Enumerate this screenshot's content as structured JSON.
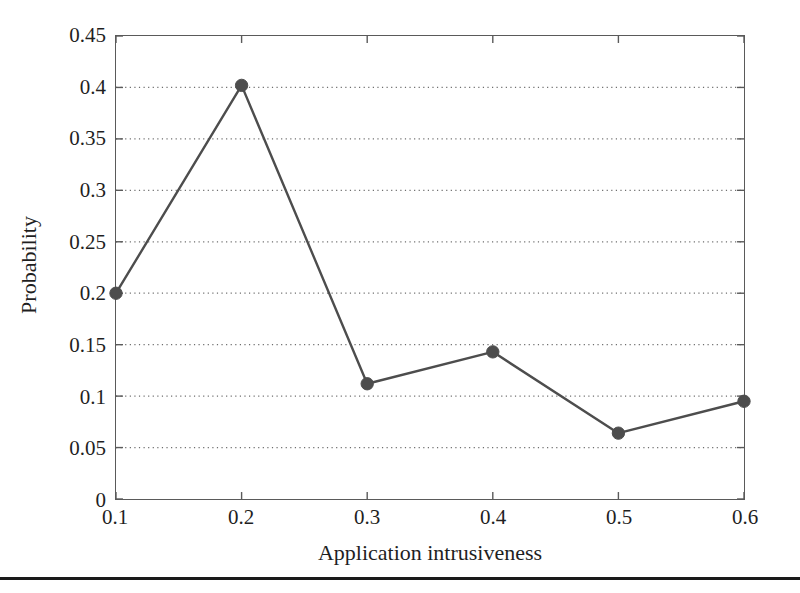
{
  "chart_data": {
    "type": "line",
    "title": "",
    "xlabel": "Application intrusiveness",
    "ylabel": "Probability",
    "x": [
      0.1,
      0.2,
      0.3,
      0.4,
      0.5,
      0.6
    ],
    "values": [
      0.2,
      0.402,
      0.112,
      0.143,
      0.064,
      0.095
    ],
    "series": [
      {
        "name": "Probability",
        "x": [
          0.1,
          0.2,
          0.3,
          0.4,
          0.5,
          0.6
        ],
        "values": [
          0.2,
          0.402,
          0.112,
          0.143,
          0.064,
          0.095
        ]
      }
    ],
    "xlim": [
      0.1,
      0.6
    ],
    "ylim": [
      0,
      0.45
    ],
    "xticks": [
      0.1,
      0.2,
      0.3,
      0.4,
      0.5,
      0.6
    ],
    "yticks": [
      0,
      0.05,
      0.1,
      0.15,
      0.2,
      0.25,
      0.3,
      0.35,
      0.4,
      0.45
    ],
    "xtick_labels": [
      "0.1",
      "0.2",
      "0.3",
      "0.4",
      "0.5",
      "0.6"
    ],
    "ytick_labels": [
      "0",
      "0.05",
      "0.1",
      "0.15",
      "0.2",
      "0.25",
      "0.3",
      "0.35",
      "0.4",
      "0.45"
    ],
    "grid": {
      "horizontal": true,
      "vertical": false,
      "style": "dotted"
    },
    "legend": {
      "visible": false,
      "position": "none",
      "entries": []
    },
    "annotations": [],
    "marker": "circle",
    "colors": {
      "line": "#4d4d4d",
      "marker": "#4d4d4d",
      "grid": "#6e6e6e",
      "frame": "#5a5a5a",
      "text": "#1f1f1f",
      "background": "#ffffff",
      "rule": "#1a1a1a"
    }
  }
}
